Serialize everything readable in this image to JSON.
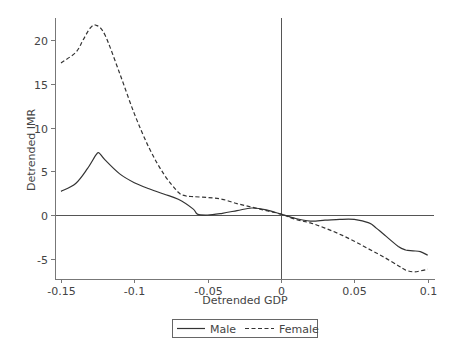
{
  "chart_data": {
    "type": "line",
    "title": "",
    "xlabel": "Detrended GDP",
    "ylabel": "Detrended IMR",
    "xlim": [
      -0.155,
      0.105
    ],
    "ylim": [
      -7.3,
      22.5
    ],
    "xticks": [
      -0.15,
      -0.1,
      -0.05,
      0,
      0.05,
      0.1
    ],
    "xtick_labels": [
      "-0.15",
      "-0.1",
      "-0.05",
      "0",
      "0.05",
      "0.1"
    ],
    "yticks": [
      -5,
      0,
      5,
      10,
      15,
      20
    ],
    "ytick_labels": [
      "-5",
      "0",
      "5",
      "10",
      "15",
      "20"
    ],
    "grid": false,
    "reference_lines": {
      "horizontal_y": 0,
      "vertical_x": 0
    },
    "legend": {
      "position": "bottom",
      "entries": [
        "Male",
        "Female"
      ]
    },
    "series": [
      {
        "name": "Male",
        "style": "solid",
        "x": [
          -0.15,
          -0.14,
          -0.132,
          -0.126,
          -0.124,
          -0.12,
          -0.11,
          -0.1,
          -0.09,
          -0.08,
          -0.07,
          -0.06,
          -0.057,
          -0.05,
          -0.04,
          -0.03,
          -0.02,
          -0.01,
          0,
          0.01,
          0.02,
          0.03,
          0.04,
          0.05,
          0.06,
          0.065,
          0.07,
          0.08,
          0.085,
          0.09,
          0.095,
          0.1
        ],
        "y": [
          2.7,
          3.6,
          5.3,
          6.9,
          7.1,
          6.3,
          4.7,
          3.7,
          3.0,
          2.4,
          1.8,
          0.7,
          0.1,
          0.0,
          0.2,
          0.5,
          0.8,
          0.6,
          0.1,
          -0.4,
          -0.7,
          -0.6,
          -0.5,
          -0.5,
          -0.9,
          -1.5,
          -2.2,
          -3.6,
          -4.0,
          -4.1,
          -4.2,
          -4.6
        ]
      },
      {
        "name": "Female",
        "style": "dashed",
        "x": [
          -0.15,
          -0.14,
          -0.135,
          -0.13,
          -0.126,
          -0.12,
          -0.11,
          -0.1,
          -0.09,
          -0.08,
          -0.07,
          -0.065,
          -0.06,
          -0.05,
          -0.04,
          -0.03,
          -0.02,
          -0.01,
          0,
          0.01,
          0.02,
          0.03,
          0.04,
          0.05,
          0.06,
          0.07,
          0.08,
          0.085,
          0.09,
          0.095,
          0.1
        ],
        "y": [
          17.4,
          18.6,
          20.0,
          21.4,
          21.7,
          20.6,
          16.2,
          11.6,
          7.7,
          4.7,
          2.6,
          2.2,
          2.1,
          2.0,
          1.8,
          1.3,
          0.9,
          0.5,
          0.1,
          -0.5,
          -0.9,
          -1.5,
          -2.2,
          -3.0,
          -3.9,
          -4.8,
          -5.8,
          -6.3,
          -6.5,
          -6.4,
          -6.2
        ]
      }
    ]
  }
}
